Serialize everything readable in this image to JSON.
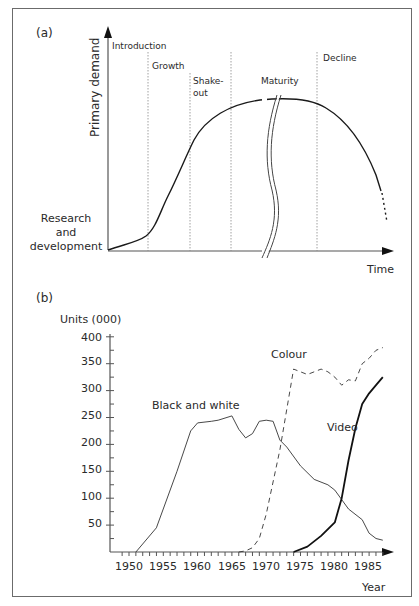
{
  "panel_a": {
    "label": "(a)",
    "y_axis_label": "Primary demand",
    "x_axis_label": "Time",
    "origin_label": [
      "Research",
      "and",
      "development"
    ],
    "stages": [
      {
        "name": "Introduction",
        "label_lines": [
          "Introduction"
        ]
      },
      {
        "name": "Growth",
        "label_lines": [
          "Growth"
        ]
      },
      {
        "name": "Shake-out",
        "label_lines": [
          "Shake-",
          "out"
        ]
      },
      {
        "name": "Maturity",
        "label_lines": [
          "Maturity"
        ]
      },
      {
        "name": "Decline",
        "label_lines": [
          "Decline"
        ]
      }
    ]
  },
  "panel_b": {
    "label": "(b)",
    "y_axis_title": "Units (000)",
    "x_axis_title": "Year",
    "y_ticks": [
      "50",
      "100",
      "150",
      "200",
      "250",
      "300",
      "350",
      "400"
    ],
    "x_ticks": [
      "1950",
      "1955",
      "1960",
      "1965",
      "1970",
      "1975",
      "1980",
      "1985"
    ],
    "series_labels": {
      "bw": "Black and white",
      "colour": "Colour",
      "video": "Video"
    }
  },
  "chart_data": [
    {
      "type": "line",
      "title": "(a) Product life cycle",
      "xlabel": "Time",
      "ylabel": "Primary demand",
      "stages": [
        "Introduction",
        "Growth",
        "Shake-out",
        "Maturity",
        "Decline"
      ],
      "origin_annotation": "Research and development",
      "series": [
        {
          "name": "Primary demand (qualitative)",
          "x": [
            0,
            10,
            20,
            30,
            40,
            50,
            60,
            70,
            80,
            90,
            100
          ],
          "values": [
            0,
            4,
            12,
            38,
            70,
            88,
            95,
            95,
            90,
            60,
            20
          ]
        }
      ],
      "annotations": [
        "Broken time axis in maturity stage",
        "Dotted continuation after decline"
      ],
      "grid": false
    },
    {
      "type": "line",
      "title": "(b)",
      "xlabel": "Year",
      "ylabel": "Units (000)",
      "ylim": [
        0,
        400
      ],
      "xlim": [
        1949,
        1988
      ],
      "y_ticks": [
        50,
        100,
        150,
        200,
        250,
        300,
        350,
        400
      ],
      "x_ticks": [
        1950,
        1955,
        1960,
        1965,
        1970,
        1975,
        1980,
        1985
      ],
      "grid": false,
      "series": [
        {
          "name": "Black and white",
          "style": "solid-thin",
          "x": [
            1951,
            1954,
            1957,
            1959,
            1960,
            1962,
            1963,
            1965,
            1966,
            1967,
            1968,
            1969,
            1970,
            1971,
            1972,
            1973,
            1975,
            1977,
            1979,
            1980,
            1982,
            1984,
            1985,
            1986,
            1987
          ],
          "values": [
            0,
            45,
            150,
            225,
            240,
            243,
            245,
            253,
            228,
            212,
            220,
            243,
            245,
            243,
            208,
            195,
            160,
            135,
            125,
            115,
            80,
            60,
            35,
            25,
            22
          ]
        },
        {
          "name": "Colour",
          "style": "dashed",
          "x": [
            1966,
            1967,
            1968,
            1969,
            1970,
            1972,
            1974,
            1976,
            1978,
            1979,
            1980,
            1981,
            1982,
            1983,
            1984,
            1985,
            1986,
            1987
          ],
          "values": [
            0,
            2,
            8,
            25,
            70,
            190,
            340,
            330,
            340,
            335,
            325,
            310,
            320,
            318,
            350,
            360,
            375,
            380
          ]
        },
        {
          "name": "Video",
          "style": "solid-thick",
          "x": [
            1974,
            1976,
            1978,
            1980,
            1981,
            1982,
            1983,
            1984,
            1985,
            1986,
            1987
          ],
          "values": [
            0,
            10,
            30,
            55,
            100,
            170,
            230,
            275,
            295,
            310,
            325
          ]
        }
      ]
    }
  ]
}
